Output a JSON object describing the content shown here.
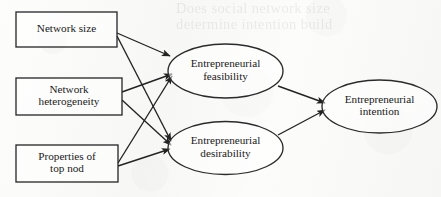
{
  "figure": {
    "kind": "conceptual-path-model",
    "medium": "scanned book page",
    "background_color": "#fbfbfa",
    "ink_color": "#222222",
    "ghost_text": "Does social network size\ndetermine intention build",
    "ghost_note": "faint bleed-through text from reverse side of page, partially illegible"
  },
  "nodes": {
    "antecedents": [
      {
        "id": "network-size",
        "shape": "rectangle",
        "line1": "Network size",
        "line2": "",
        "x": 16,
        "y": 12,
        "w": 101,
        "h": 35
      },
      {
        "id": "network-heterogeneity",
        "shape": "rectangle",
        "line1": "Network",
        "line2": "heterogeneity",
        "x": 16,
        "y": 78,
        "w": 106,
        "h": 37
      },
      {
        "id": "properties-top-node",
        "shape": "rectangle",
        "line1": "Properties of",
        "line2": "top nod",
        "x": 16,
        "y": 145,
        "w": 102,
        "h": 37
      }
    ],
    "mediators": [
      {
        "id": "entrepreneurial-feasibility",
        "shape": "ellipse",
        "line1": "Entrepreneurial",
        "line2": "feasibility",
        "cx": 225.5,
        "cy": 71,
        "rx": 57.5,
        "ry": 27
      },
      {
        "id": "entrepreneurial-desirability",
        "shape": "ellipse",
        "line1": "Entrepreneurial",
        "line2": "desirability",
        "cx": 225.5,
        "cy": 148,
        "rx": 57.5,
        "ry": 26.5
      }
    ],
    "outcome": [
      {
        "id": "entrepreneurial-intention",
        "shape": "ellipse",
        "line1": "Entrepreneurial",
        "line2": "intention",
        "cx": 379.5,
        "cy": 106.5,
        "rx": 57.5,
        "ry": 26.5
      }
    ]
  },
  "edges": [
    {
      "id": "size-to-feasibility",
      "from": "network-size",
      "to": "entrepreneurial-feasibility",
      "x1": 117,
      "y1": 33,
      "x2": 170,
      "y2": 56
    },
    {
      "id": "size-to-desirability",
      "from": "network-size",
      "to": "entrepreneurial-desirability",
      "x1": 117,
      "y1": 36,
      "x2": 171,
      "y2": 141
    },
    {
      "id": "heterogeneity-to-feasibility",
      "from": "network-heterogeneity",
      "to": "entrepreneurial-feasibility",
      "x1": 122,
      "y1": 92,
      "x2": 172,
      "y2": 74
    },
    {
      "id": "heterogeneity-to-desirability",
      "from": "network-heterogeneity",
      "to": "entrepreneurial-desirability",
      "x1": 122,
      "y1": 100,
      "x2": 171,
      "y2": 145
    },
    {
      "id": "topnode-to-feasibility",
      "from": "properties-top-node",
      "to": "entrepreneurial-feasibility",
      "x1": 118,
      "y1": 163,
      "x2": 172,
      "y2": 76
    },
    {
      "id": "topnode-to-desirability",
      "from": "properties-top-node",
      "to": "entrepreneurial-desirability",
      "x1": 118,
      "y1": 166,
      "x2": 170,
      "y2": 149
    },
    {
      "id": "feasibility-to-intention",
      "from": "entrepreneurial-feasibility",
      "to": "entrepreneurial-intention",
      "x1": 278,
      "y1": 86,
      "x2": 325,
      "y2": 103
    },
    {
      "id": "desirability-to-intention",
      "from": "entrepreneurial-desirability",
      "to": "entrepreneurial-intention",
      "x1": 278,
      "y1": 135,
      "x2": 325,
      "y2": 110
    }
  ]
}
